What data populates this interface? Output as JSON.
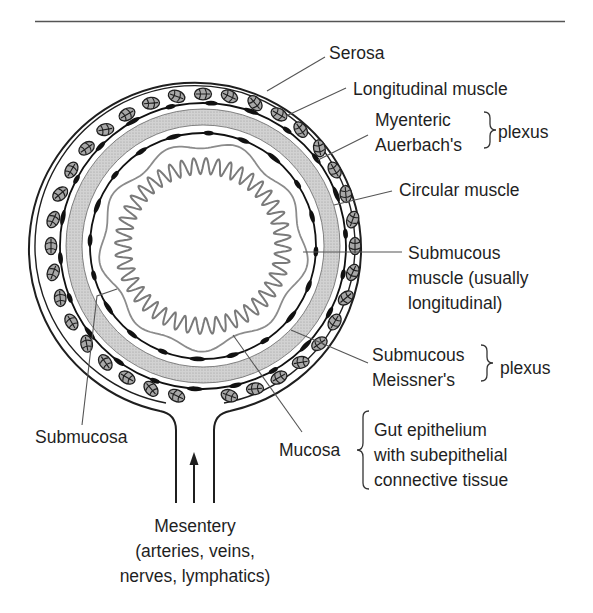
{
  "diagram": {
    "colors": {
      "ink": "#1f1f1f",
      "leader": "#555555",
      "muscle_band": "#c9c9c9",
      "mucosa_outline": "#8c8c8c",
      "villi": "#7a7a7a",
      "ganglion_fill": "#a8a8a8",
      "plexus_black": "#111111"
    },
    "labels": {
      "serosa": "Serosa",
      "longitudinal_muscle": "Longitudinal muscle",
      "myenteric_line1": "Myenteric",
      "myenteric_line2": "Auerbach's",
      "myenteric_group": "plexus",
      "circular_muscle": "Circular muscle",
      "submucous_muscle_line1": "Submucous",
      "submucous_muscle_line2": "muscle (usually",
      "submucous_muscle_line3": "longitudinal)",
      "submucous_plexus_line1": "Submucous",
      "submucous_plexus_line2": "Meissner's",
      "submucous_plexus_group": "plexus",
      "submucosa": "Submucosa",
      "mucosa": "Mucosa",
      "mucosa_desc_line1": "Gut epithelium",
      "mucosa_desc_line2": "with subepithelial",
      "mucosa_desc_line3": "connective tissue",
      "mesentery_line1": "Mesentery",
      "mesentery_line2": "(arteries, veins,",
      "mesentery_line3": "nerves, lymphatics)"
    },
    "icons": {
      "mesentery_arrow": "arrow-up-icon"
    }
  }
}
